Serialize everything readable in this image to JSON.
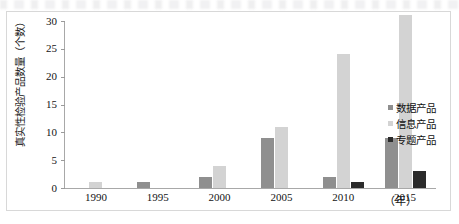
{
  "chart_data": {
    "type": "bar",
    "title": "",
    "xlabel": "（年）",
    "ylabel": "真实性检验产品数量（个数）",
    "categories": [
      "1990",
      "1995",
      "2000",
      "2005",
      "2010",
      "2015"
    ],
    "series": [
      {
        "name": "数据产品",
        "values": [
          0,
          1,
          2,
          9,
          2,
          9
        ],
        "color": "#8f8f8f"
      },
      {
        "name": "信息产品",
        "values": [
          1,
          0,
          4,
          11,
          24,
          31
        ],
        "color": "#d3d3d3"
      },
      {
        "name": "专题产品",
        "values": [
          0,
          0,
          0,
          0,
          1,
          3
        ],
        "color": "#2b2b2b"
      }
    ],
    "ylim": [
      0,
      30
    ],
    "ytick_labels": [
      "30",
      "25",
      "20",
      "15",
      "10",
      "5",
      "0"
    ],
    "ytick_values": [
      30,
      25,
      20,
      15,
      10,
      5,
      0
    ],
    "grid": false,
    "legend_position": "right-middle"
  }
}
